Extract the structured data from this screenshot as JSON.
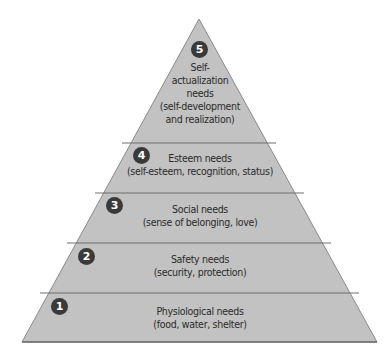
{
  "colors": {
    "fill": "#c2c2c2",
    "stroke": "#6e6e6e",
    "badge": "#3a3a3a",
    "text": "#2a2a2a"
  },
  "levels": [
    {
      "number": "5",
      "title": "Self-actualization needs",
      "lines": [
        "Self-",
        "actualization",
        "needs",
        "(self-development",
        "and realization)"
      ]
    },
    {
      "number": "4",
      "title": "Esteem needs",
      "lines": [
        "Esteem needs",
        "(self-esteem, recognition, status)"
      ]
    },
    {
      "number": "3",
      "title": "Social needs",
      "lines": [
        "Social needs",
        "(sense of belonging, love)"
      ]
    },
    {
      "number": "2",
      "title": "Safety needs",
      "lines": [
        "Safety needs",
        "(security, protection)"
      ]
    },
    {
      "number": "1",
      "title": "Physiological needs",
      "lines": [
        "Physiological needs",
        "(food, water, shelter)"
      ]
    }
  ]
}
